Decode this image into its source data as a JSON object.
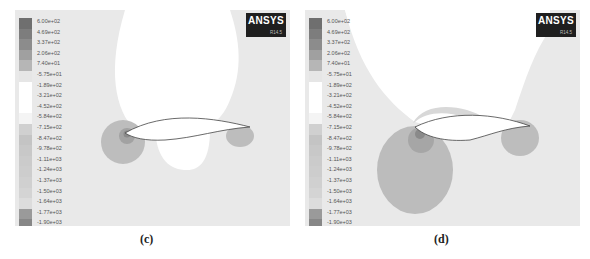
{
  "panels": [
    {
      "id": "c",
      "caption": "(c)",
      "logo": {
        "brand": "ANSYS",
        "version": "R14.5"
      }
    },
    {
      "id": "d",
      "caption": "(d)",
      "logo": {
        "brand": "ANSYS",
        "version": "R14.5"
      }
    }
  ],
  "legend": {
    "labels": [
      "6.00e+02",
      "4.69e+02",
      "3.37e+02",
      "2.06e+02",
      "7.40e+01",
      "-5.75e+01",
      "-1.89e+02",
      "-3.21e+02",
      "-4.52e+02",
      "-5.84e+02",
      "-7.15e+02",
      "-8.47e+02",
      "-9.78e+02",
      "-1.11e+03",
      "-1.24e+03",
      "-1.37e+03",
      "-1.50e+03",
      "-1.64e+03",
      "-1.77e+03",
      "-1.90e+03",
      "-2.03e+03"
    ],
    "colors": [
      "#6f6f6f",
      "#7d7d7d",
      "#8c8c8c",
      "#a0a0a0",
      "#b6b6b6",
      "#e6e6e6",
      "#ffffff",
      "#ffffff",
      "#ffffff",
      "#f4f4f4",
      "#d0d0d0",
      "#c4c4c4",
      "#c8c8c8",
      "#cbcbcb",
      "#cdcdcd",
      "#d0d0d0",
      "#d4d4d4",
      "#dcdcdc",
      "#9a9a9a",
      "#878787",
      "#7b7b7b"
    ]
  }
}
